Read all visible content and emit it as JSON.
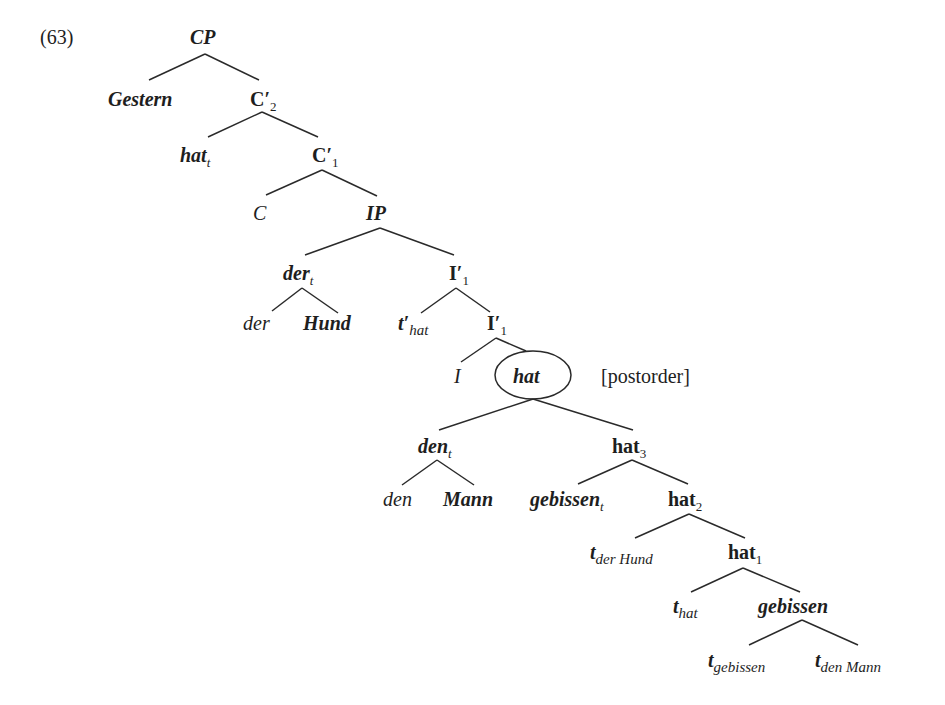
{
  "example_number": "(63)",
  "annotation": "[postorder]",
  "nodes": {
    "cp": {
      "label": "CP"
    },
    "gestern": {
      "label": "Gestern"
    },
    "c2": {
      "label": "C′",
      "sub": "2"
    },
    "hat_t": {
      "label": "hat",
      "sub": "t"
    },
    "c1": {
      "label": "C′",
      "sub": "1"
    },
    "c": {
      "label": "C"
    },
    "ip": {
      "label": "IP"
    },
    "der_t": {
      "label": "der",
      "sub": "t"
    },
    "i1_upper": {
      "label": "I′",
      "sub": "1"
    },
    "der": {
      "label": "der"
    },
    "hund": {
      "label": "Hund"
    },
    "t_prime_hat": {
      "label": "t′",
      "sub": "hat"
    },
    "i1_lower": {
      "label": "I′",
      "sub": "1"
    },
    "i": {
      "label": "I"
    },
    "hat_circled": {
      "label": "hat"
    },
    "den_t": {
      "label": "den",
      "sub": "t"
    },
    "hat3": {
      "label": "hat",
      "sub": "3"
    },
    "den": {
      "label": "den"
    },
    "mann": {
      "label": "Mann"
    },
    "gebissen_t": {
      "label": "gebissen",
      "sub": "t"
    },
    "hat2": {
      "label": "hat",
      "sub": "2"
    },
    "t_der_hund": {
      "label": "t",
      "sub": "der Hund"
    },
    "hat1": {
      "label": "hat",
      "sub": "1"
    },
    "t_hat": {
      "label": "t",
      "sub": "hat"
    },
    "gebissen": {
      "label": "gebissen"
    },
    "t_gebissen": {
      "label": "t",
      "sub": "gebissen"
    },
    "t_den_mann": {
      "label": "t",
      "sub": "den Mann"
    }
  },
  "colors": {
    "ink": "#1e1e1e",
    "background": "#ffffff"
  }
}
